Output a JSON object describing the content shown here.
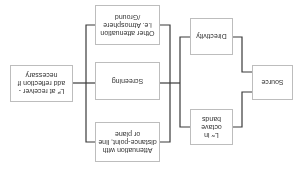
{
  "diagram": {
    "orientation": "rotated-180",
    "nodes": {
      "source": {
        "label": "Source"
      },
      "directivity": {
        "label": "Directivity"
      },
      "lw_octave": {
        "label": "Lʷ in octave bands"
      },
      "distance_attenuation": {
        "label": "Attenuation with distance-point, line or plane"
      },
      "screening": {
        "label": "Screening"
      },
      "other_attenuation": {
        "label": "Other attenuation i.e. Atmosphere /Ground"
      },
      "receiver": {
        "label": "Lᴾ at receiver -add reflection if necessary"
      }
    },
    "edges": [
      [
        "source",
        "directivity"
      ],
      [
        "source",
        "lw_octave"
      ],
      [
        "directivity",
        "distance_attenuation"
      ],
      [
        "directivity",
        "screening"
      ],
      [
        "directivity",
        "other_attenuation"
      ],
      [
        "lw_octave",
        "distance_attenuation"
      ],
      [
        "lw_octave",
        "screening"
      ],
      [
        "lw_octave",
        "other_attenuation"
      ],
      [
        "distance_attenuation",
        "receiver"
      ],
      [
        "screening",
        "receiver"
      ],
      [
        "other_attenuation",
        "receiver"
      ]
    ],
    "colors": {
      "line": "#3a3a3a",
      "box_border": "#bdbdbd",
      "text": "#333333"
    }
  }
}
